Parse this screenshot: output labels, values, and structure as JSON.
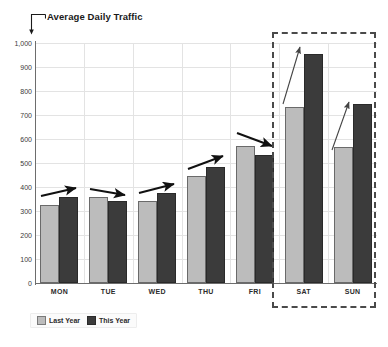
{
  "chart_data": {
    "type": "bar",
    "title": "Average Daily Traffic",
    "xlabel": "",
    "ylabel": "",
    "ylim": [
      0,
      1000
    ],
    "yticks": [
      "0",
      "100",
      "200",
      "300",
      "400",
      "500",
      "600",
      "700",
      "800",
      "900",
      "1,000"
    ],
    "grid": true,
    "legend_position": "bottom-left",
    "categories": [
      "MON",
      "TUE",
      "WED",
      "THU",
      "FRI",
      "SAT",
      "SUN"
    ],
    "series": [
      {
        "name": "Last Year",
        "color": "#bcbcbc",
        "values": [
          325,
          360,
          340,
          445,
          570,
          735,
          565
        ]
      },
      {
        "name": "This Year",
        "color": "#3b3b3b",
        "values": [
          360,
          340,
          375,
          485,
          535,
          955,
          745
        ]
      }
    ],
    "annotations": {
      "trend_arrows": [
        {
          "category": "MON",
          "direction": "up"
        },
        {
          "category": "TUE",
          "direction": "down"
        },
        {
          "category": "WED",
          "direction": "up"
        },
        {
          "category": "THU",
          "direction": "up"
        },
        {
          "category": "FRI",
          "direction": "down"
        },
        {
          "category": "SAT",
          "direction": "up-steep"
        },
        {
          "category": "SUN",
          "direction": "up-steep"
        }
      ],
      "highlight_region": {
        "label": "weekend",
        "categories": [
          "SAT",
          "SUN"
        ],
        "style": "dashed-box",
        "color": "#4a4a4a"
      },
      "title_leader": {
        "style": "bracket-pointer",
        "color": "#1a1a1a"
      }
    }
  },
  "legend": {
    "items": [
      {
        "label": "Last Year"
      },
      {
        "label": "This Year"
      }
    ]
  },
  "colors": {
    "last_year": "#bcbcbc",
    "this_year": "#3b3b3b",
    "axis": "#6d6d6d",
    "grid": "#e3e3e3",
    "highlight": "#4a4a4a",
    "text": "#2b2b2b",
    "background": "#ffffff"
  }
}
